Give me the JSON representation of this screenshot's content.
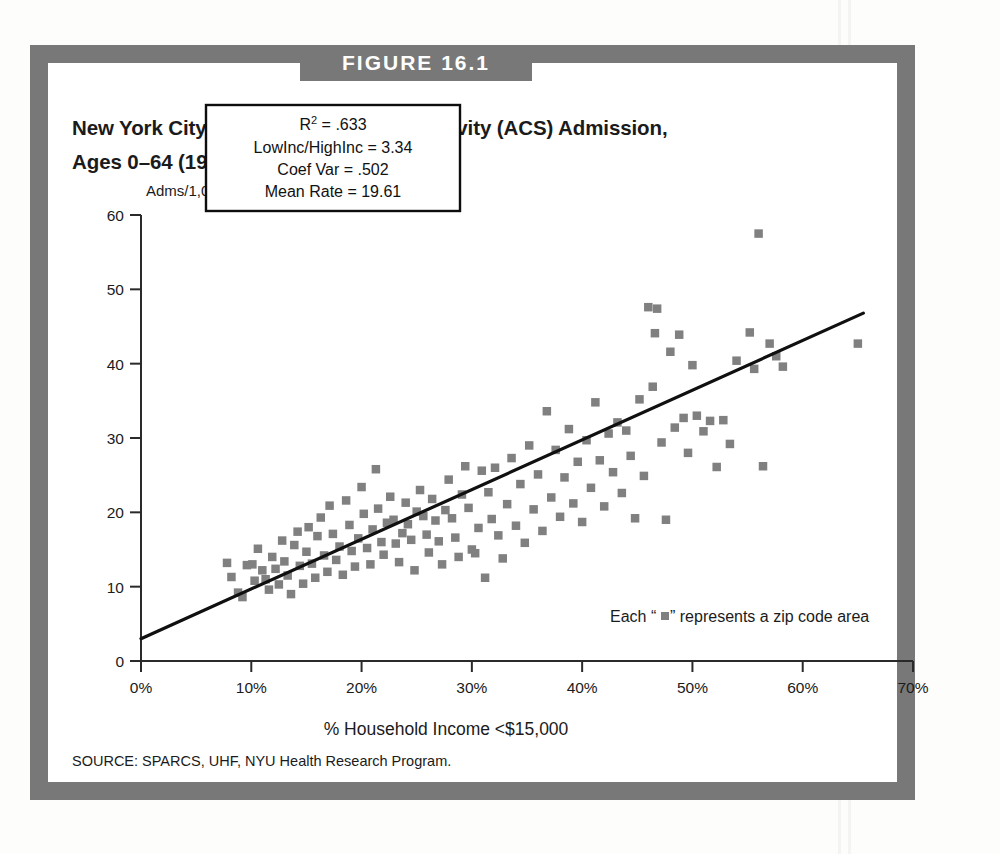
{
  "figure": {
    "banner_label": "FIGURE 16.1",
    "title_line1": "New York City: Ambulatory-Care-Sensitivity (ACS) Admission,",
    "title_line2": "Ages 0–64 (1995)",
    "source": "SOURCE: SPARCS, UHF, NYU Health Research Program.",
    "frame_color": "#787878",
    "marker_color": "#808080",
    "line_color": "#101010"
  },
  "stats_box": {
    "r_squared_label": "R² = .633",
    "r_squared_base": "R",
    "r_squared_exp": "2",
    "r_squared_value": " = .633",
    "low_high_inc": "LowInc/HighInc = 3.34",
    "coef_var": "Coef Var = .502",
    "mean_rate": "Mean Rate = 19.61"
  },
  "annotation": {
    "zip_note": "Each “▪” represents a zip code area",
    "zip_note_prefix": "Each “",
    "zip_note_suffix": "” represents a zip code area"
  },
  "chart_data": {
    "type": "scatter",
    "title": "New York City: Ambulatory-Care-Sensitivity (ACS) Admission, Ages 0–64 (1995)",
    "xlabel": "% Household Income <$15,000",
    "ylabel": "Adms/1,000",
    "ylabel_unit": "Adms/1,000",
    "xlim": [
      0,
      70
    ],
    "ylim": [
      0,
      60
    ],
    "xticks": [
      0,
      10,
      20,
      30,
      40,
      50,
      60,
      70
    ],
    "xtick_labels": [
      "0%",
      "10%",
      "20%",
      "30%",
      "40%",
      "50%",
      "60%",
      "70%"
    ],
    "yticks": [
      0,
      10,
      20,
      30,
      40,
      50,
      60
    ],
    "ytick_labels": [
      "0",
      "10",
      "20",
      "30",
      "40",
      "50",
      "60"
    ],
    "grid": false,
    "legend": "none",
    "marker": "square",
    "marker_label": "Each “▪” represents a zip code area",
    "trendline": {
      "type": "linear-regression",
      "x_start": 0,
      "y_start": 3.0,
      "x_end": 65.5,
      "y_end": 46.8,
      "slope": 0.669,
      "intercept": 3.0
    },
    "statistics": {
      "r_squared": 0.633,
      "low_inc_high_inc_ratio": 3.34,
      "coef_var": 0.502,
      "mean_rate": 19.61
    },
    "points": [
      [
        7.8,
        13.2
      ],
      [
        8.2,
        11.3
      ],
      [
        8.8,
        9.2
      ],
      [
        9.2,
        8.6
      ],
      [
        9.6,
        12.9
      ],
      [
        10.1,
        13.0
      ],
      [
        10.3,
        10.8
      ],
      [
        10.6,
        15.1
      ],
      [
        11.0,
        12.2
      ],
      [
        11.3,
        11.0
      ],
      [
        11.6,
        9.6
      ],
      [
        11.9,
        14.0
      ],
      [
        12.2,
        12.4
      ],
      [
        12.5,
        10.3
      ],
      [
        12.8,
        16.2
      ],
      [
        13.0,
        13.4
      ],
      [
        13.3,
        11.5
      ],
      [
        13.6,
        9.0
      ],
      [
        13.9,
        15.6
      ],
      [
        14.2,
        17.4
      ],
      [
        14.4,
        12.8
      ],
      [
        14.7,
        10.4
      ],
      [
        15.0,
        14.7
      ],
      [
        15.2,
        18.0
      ],
      [
        15.5,
        13.1
      ],
      [
        15.8,
        11.2
      ],
      [
        16.0,
        16.8
      ],
      [
        16.3,
        19.3
      ],
      [
        16.6,
        14.2
      ],
      [
        16.9,
        12.0
      ],
      [
        17.1,
        20.9
      ],
      [
        17.4,
        17.1
      ],
      [
        17.7,
        13.6
      ],
      [
        18.0,
        15.4
      ],
      [
        18.3,
        11.6
      ],
      [
        18.6,
        21.6
      ],
      [
        18.9,
        18.3
      ],
      [
        19.1,
        14.8
      ],
      [
        19.4,
        12.7
      ],
      [
        19.7,
        16.5
      ],
      [
        20.0,
        23.4
      ],
      [
        20.2,
        19.8
      ],
      [
        20.5,
        15.2
      ],
      [
        20.8,
        13.0
      ],
      [
        21.0,
        17.7
      ],
      [
        21.3,
        25.8
      ],
      [
        21.5,
        20.5
      ],
      [
        21.8,
        16.0
      ],
      [
        22.0,
        14.3
      ],
      [
        22.3,
        18.6
      ],
      [
        22.6,
        22.1
      ],
      [
        22.9,
        19.0
      ],
      [
        23.1,
        15.8
      ],
      [
        23.4,
        13.3
      ],
      [
        23.7,
        17.2
      ],
      [
        24.0,
        21.3
      ],
      [
        24.2,
        18.4
      ],
      [
        24.5,
        16.3
      ],
      [
        24.8,
        12.2
      ],
      [
        25.0,
        20.1
      ],
      [
        25.3,
        23.0
      ],
      [
        25.6,
        19.5
      ],
      [
        25.9,
        17.0
      ],
      [
        26.1,
        14.6
      ],
      [
        26.4,
        21.8
      ],
      [
        26.7,
        18.9
      ],
      [
        27.0,
        16.1
      ],
      [
        27.3,
        13.0
      ],
      [
        27.6,
        20.3
      ],
      [
        27.9,
        24.4
      ],
      [
        28.2,
        19.2
      ],
      [
        28.5,
        16.6
      ],
      [
        28.8,
        14.0
      ],
      [
        29.1,
        22.4
      ],
      [
        29.4,
        26.2
      ],
      [
        29.7,
        20.6
      ],
      [
        30.0,
        15.0
      ],
      [
        30.3,
        14.5
      ],
      [
        30.6,
        17.9
      ],
      [
        30.9,
        25.6
      ],
      [
        31.2,
        11.2
      ],
      [
        31.5,
        22.7
      ],
      [
        31.8,
        19.1
      ],
      [
        32.1,
        26.0
      ],
      [
        32.4,
        16.9
      ],
      [
        32.8,
        13.8
      ],
      [
        33.2,
        21.1
      ],
      [
        33.6,
        27.3
      ],
      [
        34.0,
        18.2
      ],
      [
        34.4,
        23.8
      ],
      [
        34.8,
        15.9
      ],
      [
        35.2,
        29.0
      ],
      [
        35.6,
        20.4
      ],
      [
        36.0,
        25.1
      ],
      [
        36.4,
        17.5
      ],
      [
        36.8,
        33.6
      ],
      [
        37.2,
        22.0
      ],
      [
        37.6,
        28.4
      ],
      [
        38.0,
        19.4
      ],
      [
        38.4,
        24.7
      ],
      [
        38.8,
        31.2
      ],
      [
        39.2,
        21.2
      ],
      [
        39.6,
        26.8
      ],
      [
        40.0,
        18.7
      ],
      [
        40.4,
        29.7
      ],
      [
        40.8,
        23.3
      ],
      [
        41.2,
        34.8
      ],
      [
        41.6,
        27.0
      ],
      [
        42.0,
        20.8
      ],
      [
        42.4,
        30.6
      ],
      [
        42.8,
        25.4
      ],
      [
        43.2,
        32.1
      ],
      [
        43.6,
        22.6
      ],
      [
        44.0,
        31.0
      ],
      [
        44.4,
        27.6
      ],
      [
        44.8,
        19.2
      ],
      [
        45.2,
        35.2
      ],
      [
        45.6,
        24.9
      ],
      [
        46.0,
        47.6
      ],
      [
        46.4,
        36.9
      ],
      [
        46.6,
        44.1
      ],
      [
        46.8,
        47.4
      ],
      [
        47.2,
        29.4
      ],
      [
        47.6,
        19.0
      ],
      [
        48.0,
        41.6
      ],
      [
        48.4,
        31.4
      ],
      [
        48.8,
        43.9
      ],
      [
        49.2,
        32.7
      ],
      [
        49.6,
        28.0
      ],
      [
        50.0,
        39.8
      ],
      [
        50.4,
        33.0
      ],
      [
        51.0,
        30.9
      ],
      [
        51.6,
        32.3
      ],
      [
        52.2,
        26.1
      ],
      [
        52.8,
        32.4
      ],
      [
        53.4,
        29.2
      ],
      [
        54.0,
        40.4
      ],
      [
        55.2,
        44.2
      ],
      [
        55.6,
        39.3
      ],
      [
        56.0,
        57.5
      ],
      [
        56.4,
        26.2
      ],
      [
        57.0,
        42.7
      ],
      [
        57.6,
        41.0
      ],
      [
        58.2,
        39.6
      ],
      [
        65.0,
        42.7
      ]
    ]
  }
}
